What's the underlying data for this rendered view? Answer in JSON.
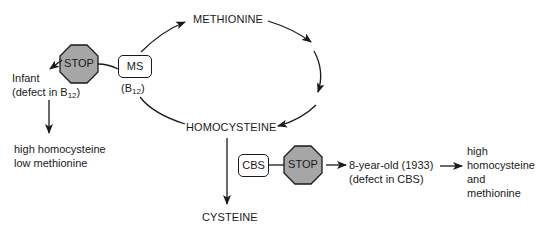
{
  "diagram": {
    "cycle": {
      "methionine": "METHIONINE",
      "homocysteine": "HOMOCYSTEINE",
      "cysteine": "CYSTEINE"
    },
    "enzymes": {
      "ms": {
        "label": "MS",
        "cofactor_prefix": "(B",
        "cofactor_sub": "12",
        "cofactor_suffix": ")"
      },
      "cbs": {
        "label": "CBS"
      }
    },
    "stop_signs": [
      {
        "label": "STOP",
        "color": "#a6a6a6"
      },
      {
        "label": "STOP",
        "color": "#a6a6a6"
      }
    ],
    "infant_case": {
      "line1": "Infant",
      "line2_prefix": "(defect in B",
      "line2_sub": "12",
      "line2_suffix": ")",
      "outcome_line1": "high homocysteine",
      "outcome_line2": "low methionine"
    },
    "child_case": {
      "line1": "8-year-old (1933)",
      "line2": "(defect in CBS)",
      "outcome_line1": "high",
      "outcome_line2": "homocysteine",
      "outcome_line3": "and",
      "outcome_line4": "methionine"
    }
  }
}
